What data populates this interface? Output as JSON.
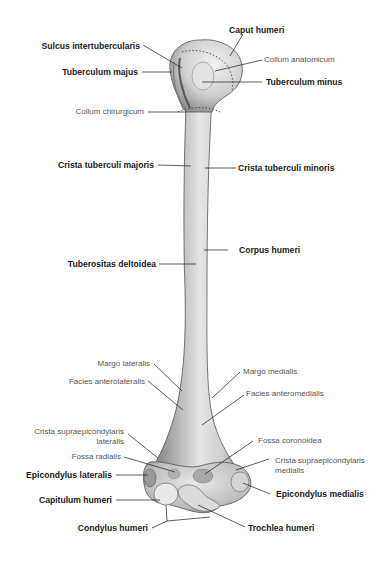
{
  "labels": {
    "caput_humeri": "Caput humeri",
    "sulcus_intertubercularis": "Sulcus intertubercularis",
    "collum_anatomicum": "Collum anatomicum",
    "tuberculum_majus": "Tuberculum majus",
    "tuberculum_minus": "Tuberculum minus",
    "collum_chirurgicum": "Collum chirurgicum",
    "crista_tuberculi_majoris": "Crista tuberculi majoris",
    "crista_tuberculi_minoris": "Crista tuberculi minoris",
    "corpus_humeri": "Corpus humeri",
    "tuberositas_deltoidea": "Tuberositas deltoidea",
    "margo_lateralis": "Margo lateralis",
    "margo_medialis": "Margo medialis",
    "facies_anterolateralis": "Facies anterolateralis",
    "facies_anteromedialis": "Facies anteromedialis",
    "crista_supraepicondylaris_lateralis_1": "Crista supraepicondylaris",
    "crista_supraepicondylaris_lateralis_2": "lateralis",
    "fossa_coronoidea": "Fossa coronoidea",
    "fossa_radialis": "Fossa radialis",
    "crista_supraepicondylaris_medialis_1": "Crista supraepicondylaris",
    "crista_supraepicondylaris_medialis_2": "medialis",
    "epicondylus_lateralis": "Epicondylus lateralis",
    "epicondylus_medialis": "Epicondylus medialis",
    "capitulum_humeri": "Capitulum humeri",
    "condylus_humeri": "Condylus humeri",
    "trochlea_humeri": "Trochlea humeri"
  },
  "colors": {
    "bone_light": "#e6e6e6",
    "bone_mid": "#b5b5b5",
    "bone_dark": "#6e6e6e",
    "leader_line": "#333333",
    "text_bold": "#1a1a1a",
    "text_light": "#555555"
  }
}
